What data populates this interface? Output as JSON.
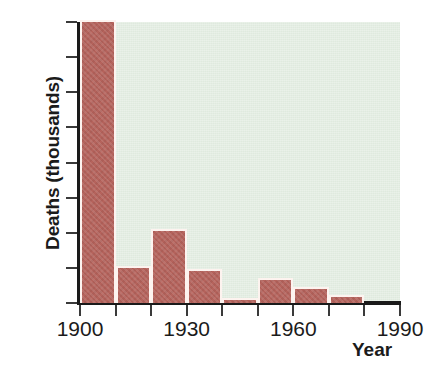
{
  "chart_data": {
    "type": "bar",
    "title": "",
    "xlabel": "Year",
    "ylabel": "Deaths (thousands)",
    "categories": [
      "1900",
      "1910",
      "1920",
      "1930",
      "1940",
      "1950",
      "1960",
      "1970",
      "1980"
    ],
    "values": [
      8.05,
      1.05,
      2.1,
      0.97,
      0.15,
      0.7,
      0.45,
      0.22,
      0
    ],
    "x": [
      1900,
      1910,
      1920,
      1930,
      1940,
      1950,
      1960,
      1970,
      1980
    ],
    "bar_width_years": 10,
    "xlim": [
      1900,
      1990
    ],
    "ylim": [
      0,
      8
    ],
    "yticks": [
      "8",
      "7",
      "6",
      "5",
      "4",
      "3",
      "2",
      "1",
      "0"
    ],
    "ytick_values": [
      8,
      7,
      6,
      5,
      4,
      3,
      2,
      1,
      0
    ],
    "xticks": [
      "1900",
      "",
      "",
      "1930",
      "",
      "",
      "1960",
      "",
      "",
      "1990"
    ],
    "xtick_values": [
      1900,
      1910,
      1920,
      1930,
      1940,
      1950,
      1960,
      1970,
      1980,
      1990
    ],
    "xtick_labeled": [
      1900,
      1930,
      1960,
      1990
    ],
    "grid": false,
    "legend": null,
    "colors": {
      "bar": "#b5635c",
      "bar_edge": "#fdf3ef",
      "plot_background": "#dfeade",
      "axis": "#1a1a1a",
      "text": "#1b1b1b",
      "figure_background": "#ffffff"
    }
  }
}
